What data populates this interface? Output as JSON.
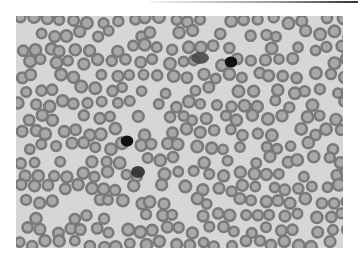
{
  "image": {
    "subject": "Peripheral blood smear micrograph (grayscale)",
    "background_color": "#d6d6d6",
    "rbc_ring_color": "#7a7a7a",
    "rbc_center_color": "#a8a8a8",
    "frame": {
      "x": 16,
      "y": 16,
      "width": 327,
      "height": 232
    }
  },
  "cells": {
    "rbc_grid": {
      "cols": 24,
      "rows": 17,
      "spacing_x": 14,
      "spacing_y": 14,
      "radius": 5.2,
      "seed": 7
    },
    "lymphocytes": [
      {
        "label": "small-lymphocyte-upper",
        "cx": 231,
        "cy": 62,
        "r": 5.5,
        "color": "#111111"
      },
      {
        "label": "small-lymphocyte-middle",
        "cx": 127,
        "cy": 141,
        "r": 5.5,
        "color": "#111111"
      }
    ],
    "platelet_clumps": [
      {
        "label": "platelet-clump-upper",
        "cx": 200,
        "cy": 58,
        "rx": 9,
        "ry": 6,
        "color": "#4a4a4a"
      },
      {
        "label": "platelet-clump-lower",
        "cx": 138,
        "cy": 172,
        "rx": 7,
        "ry": 6,
        "color": "#2e2e2e"
      }
    ]
  }
}
